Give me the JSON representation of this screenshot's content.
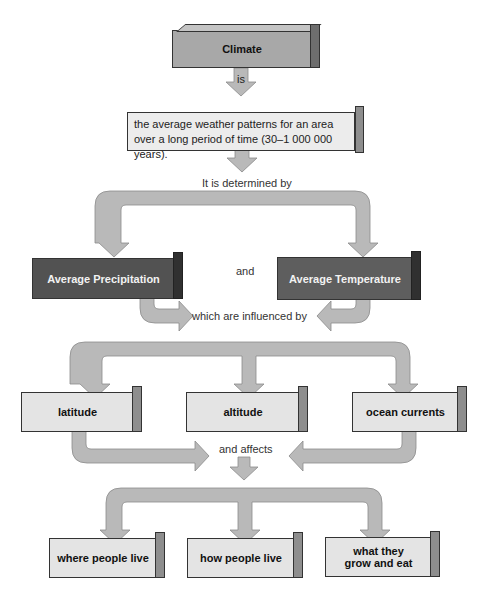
{
  "diagram": {
    "root": {
      "label": "Climate"
    },
    "link_is": "is",
    "definition": "the average weather patterns for an area over a long period of time (30–1 000 000 years).",
    "determined_by": "It is determined by",
    "factors": [
      {
        "label": "Average Precipitation"
      },
      {
        "label": "Average Temperature"
      }
    ],
    "and_label": "and",
    "influenced_by": "which are influenced by",
    "influences": [
      {
        "label": "latitude"
      },
      {
        "label": "altitude"
      },
      {
        "label": "ocean currents"
      }
    ],
    "and_affects": "and affects",
    "effects": [
      {
        "label": "where people live"
      },
      {
        "label": "how people live"
      },
      {
        "label": "what they grow and eat"
      }
    ]
  },
  "colors": {
    "arrow_fill": "#b4b4b4",
    "root_box": "#a8a8a8",
    "factor_box": "#525252",
    "leaf_box": "#e4e4e4"
  }
}
